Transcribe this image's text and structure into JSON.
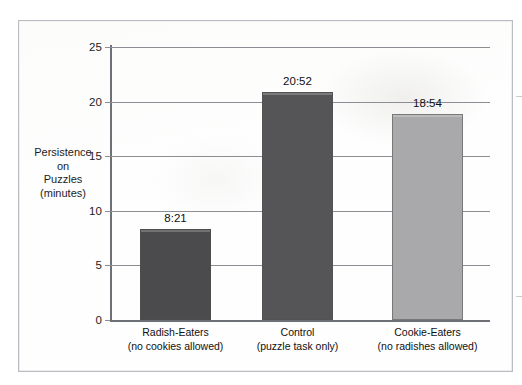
{
  "figure": {
    "border_color": "#b9bcc0",
    "background": "#fefefe"
  },
  "chart_data": {
    "type": "bar",
    "title": "",
    "subtitle": "",
    "xlabel": "",
    "ylabel": "Persistence on Puzzles (minutes)",
    "ylabel_lines": [
      "Persistence",
      "on",
      "Puzzles",
      "(minutes)"
    ],
    "categories": [
      "Radish-Eaters",
      "Control",
      "Cookie-Eaters"
    ],
    "category_sublabels": [
      "(no cookies allowed)",
      "(puzzle task only)",
      "(no radishes allowed)"
    ],
    "values": [
      8.35,
      20.87,
      18.9
    ],
    "data_labels": [
      "8:21",
      "20:52",
      "18:54"
    ],
    "bar_colors": [
      "#4b4b4d",
      "#555558",
      "#a9a9ab"
    ],
    "ylim": [
      0,
      25
    ],
    "yticks": [
      0,
      5,
      10,
      15,
      20,
      25
    ],
    "ytick_labels": [
      "0",
      "5",
      "10",
      "15",
      "20",
      "25"
    ],
    "grid": true,
    "grid_color": "#8b8e92",
    "legend": false,
    "legend_position": "none"
  }
}
